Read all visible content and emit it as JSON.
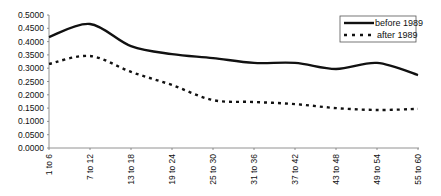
{
  "chart_data": {
    "type": "line",
    "title": "",
    "xlabel": "",
    "ylabel": "",
    "categories": [
      "1 to 6",
      "7 to 12",
      "13 to 18",
      "19 to 24",
      "25 to 30",
      "31 to 36",
      "37 to 42",
      "43 to 48",
      "49 to 54",
      "55 to 60"
    ],
    "series": [
      {
        "name": "before 1989",
        "style": "solid",
        "color": "#111111",
        "values": [
          0.417,
          0.466,
          0.383,
          0.353,
          0.338,
          0.32,
          0.32,
          0.297,
          0.32,
          0.274
        ]
      },
      {
        "name": "after 1989",
        "style": "dashed",
        "color": "#111111",
        "values": [
          0.316,
          0.346,
          0.286,
          0.237,
          0.18,
          0.173,
          0.165,
          0.15,
          0.143,
          0.147
        ]
      }
    ],
    "yticks": [
      "0.0000",
      "0.0500",
      "0.1000",
      "0.1500",
      "0.2000",
      "0.2500",
      "0.3000",
      "0.3500",
      "0.4000",
      "0.4500",
      "0.5000"
    ],
    "ylim": [
      0,
      0.5
    ],
    "grid": false,
    "legend_position": "upper right"
  }
}
